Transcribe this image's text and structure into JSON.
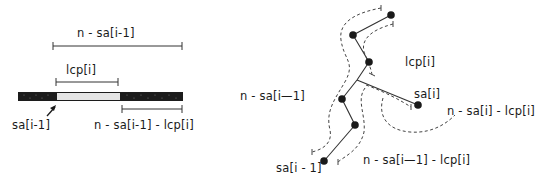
{
  "left_diagram": {
    "labels": {
      "top_span": "n - sa[i-1]",
      "lcp_span": "lcp[i]",
      "start_pointer": "sa[i-1]",
      "remainder_span": "n - sa[i-1] - lcp[i]"
    },
    "bar": {
      "dark_color": "#1c1c1c",
      "light_color": "#e4e4e4"
    }
  },
  "right_diagram": {
    "labels": {
      "lcp": "lcp[i]",
      "left_path": "n - sa[i—1]",
      "sa_i": "sa[i]",
      "sa_i_remainder": "n - sa[i] - lcp[i]",
      "sa_prev": "sa[i - 1]",
      "sa_prev_remainder": "n - sa[i—1] - lcp[i]"
    },
    "node_color": "#1a1a1a"
  }
}
